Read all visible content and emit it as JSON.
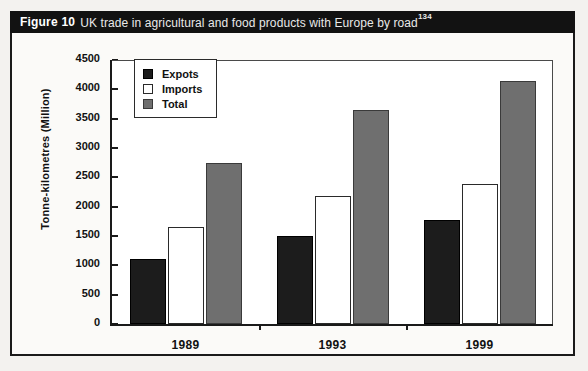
{
  "caption": {
    "figure_number": "Figure 10",
    "text": "UK trade in agricultural and food products with Europe by road",
    "superscript": "134"
  },
  "chart_data": {
    "type": "bar",
    "title": "UK trade in agricultural and food products with Europe by road",
    "categories": [
      "1989",
      "1993",
      "1999"
    ],
    "series": [
      {
        "name": "Expots",
        "values": [
          1100,
          1500,
          1770
        ],
        "color": "#1c1c1c"
      },
      {
        "name": "Imports",
        "values": [
          1650,
          2175,
          2390
        ],
        "color": "#ffffff"
      },
      {
        "name": "Total",
        "values": [
          2750,
          3650,
          4150
        ],
        "color": "#6f6f6f"
      }
    ],
    "xlabel": "",
    "ylabel": "Tonne-kilometres (Million)",
    "ylim": [
      0,
      4500
    ],
    "ytick_step": 500,
    "yticks": [
      0,
      500,
      1000,
      1500,
      2000,
      2500,
      3000,
      3500,
      4000,
      4500
    ],
    "ytick_labels": [
      "0",
      "500",
      "1000",
      "1500",
      "2000",
      "2500",
      "3000",
      "3500",
      "4000",
      "4500"
    ],
    "grid": false,
    "legend_position": "top-left-inside"
  },
  "colors": {
    "caption_bar": "#121212",
    "frame": "#1a1a1a",
    "plot_background": "#ffffff",
    "page_background": "#f3f2ef"
  }
}
